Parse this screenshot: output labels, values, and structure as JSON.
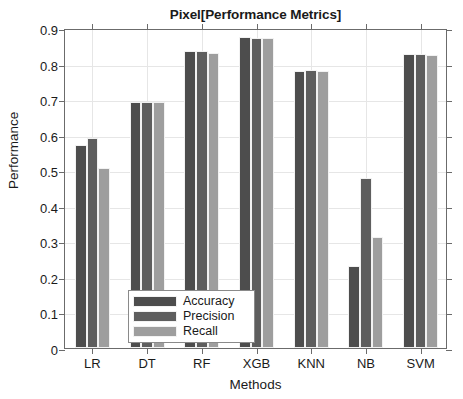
{
  "chart_data": {
    "type": "bar",
    "title": "Pixel[Performance Metrics]",
    "xlabel": "Methods",
    "ylabel": "Performance",
    "categories": [
      "LR",
      "DT",
      "RF",
      "XGB",
      "KNN",
      "NB",
      "SVM"
    ],
    "series": [
      {
        "name": "Accuracy",
        "color": "#4d4d4d",
        "values": [
          0.572,
          0.693,
          0.834,
          0.874,
          0.78,
          0.232,
          0.827
        ]
      },
      {
        "name": "Precision",
        "color": "#5e5e5e",
        "values": [
          0.59,
          0.693,
          0.835,
          0.872,
          0.781,
          0.478,
          0.827
        ]
      },
      {
        "name": "Recall",
        "color": "#9e9e9e",
        "values": [
          0.505,
          0.692,
          0.831,
          0.872,
          0.779,
          0.312,
          0.825
        ]
      }
    ],
    "ylim": [
      0,
      0.9
    ],
    "ytick_labels": [
      "0",
      "0.1",
      "0.2",
      "0.3",
      "0.4",
      "0.5",
      "0.6",
      "0.7",
      "0.8",
      "0.9"
    ],
    "ytick_values": [
      0,
      0.1,
      0.2,
      0.3,
      0.4,
      0.5,
      0.6,
      0.7,
      0.8,
      0.9
    ],
    "grid": true,
    "legend_position": "bottom-left",
    "legend_entries": [
      "Accuracy",
      "Precision",
      "Recall"
    ]
  }
}
